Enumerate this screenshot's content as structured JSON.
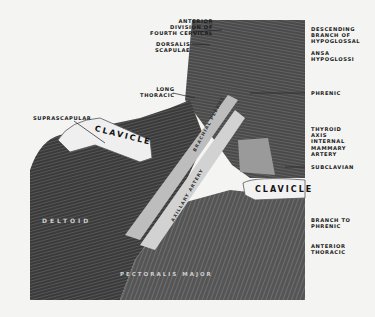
{
  "figure": {
    "background": "#f4f4f2",
    "labels_left": {
      "anterior_division": "ANTERIOR\nDIVISION OF\nFOURTH CERVICAL",
      "dorsalis_scapulae": "DORSALIS\nSCAPULAE",
      "long_thoracic": "LONG\nTHORACIC",
      "suprascapular": "SUPRASCAPULAR"
    },
    "labels_right": {
      "descending_branch": "DESCENDING\nBRANCH OF\nHYPOGLOSSAL",
      "ansa_hypoglossi": "ANSA\nHYPOGLOSSI",
      "phrenic": "PHRENIC",
      "thyroid_axis": "THYROID\nAXIS\nINTERNAL\nMAMMARY\nARTERY",
      "subclavian": "SUBCLAVIAN",
      "branch_to_phrenic": "BRANCH TO\nPHRENIC",
      "anterior_thoracic": "ANTERIOR\nTHORACIC"
    },
    "structure_labels": {
      "clavicle_left": "CLAVICLE",
      "clavicle_right": "CLAVICLE",
      "deltoid": "DELTOID",
      "pectoralis_major": "PECTORALIS MAJOR",
      "brachial_plexus": "BRACHIAL PLEXUS",
      "axillary_artery": "AXILLARY ARTERY"
    }
  }
}
